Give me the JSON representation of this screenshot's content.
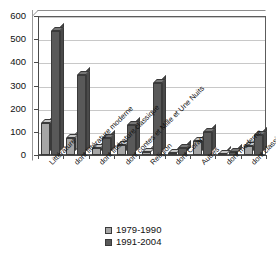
{
  "chart_data": {
    "type": "bar",
    "title": "",
    "subtitle": "",
    "xlabel": "",
    "ylabel": "",
    "ylim": [
      0,
      600
    ],
    "yticks": [
      0,
      100,
      200,
      300,
      400,
      500,
      600
    ],
    "grid": true,
    "legend_position": "bottom-center",
    "categories": [
      "Littérature",
      "dont littérature moderne",
      "dont littérature classique",
      "dont contes et Mille et Une Nuits",
      "Religion",
      "dont Coran",
      "Autres",
      "dont moderne",
      "dont classique"
    ],
    "series": [
      {
        "name": "1979-1990",
        "color": "#a6a6a6",
        "values": [
          140,
          75,
          30,
          42,
          12,
          8,
          60,
          5,
          38
        ]
      },
      {
        "name": "1991-2004",
        "color": "#595959",
        "values": [
          535,
          345,
          72,
          128,
          310,
          30,
          100,
          12,
          88
        ]
      }
    ]
  },
  "legend": {
    "items": [
      {
        "label": "1979-1990",
        "color": "#a6a6a6"
      },
      {
        "label": "1991-2004",
        "color": "#595959"
      }
    ]
  }
}
